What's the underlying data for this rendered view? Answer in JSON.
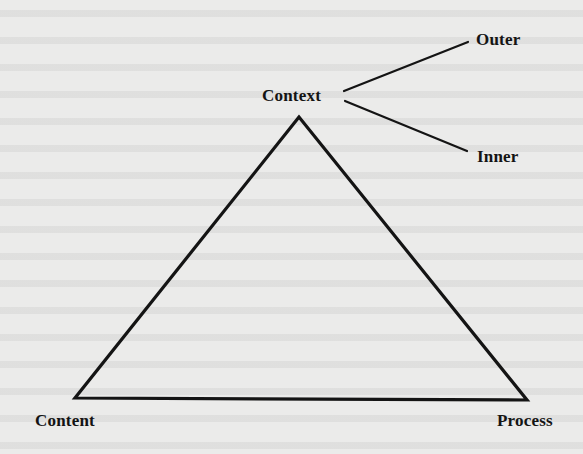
{
  "diagram": {
    "type": "triangle-with-branches",
    "nodes": {
      "context": {
        "label": "Context",
        "position": "apex"
      },
      "content": {
        "label": "Content",
        "position": "bottom-left"
      },
      "process": {
        "label": "Process",
        "position": "bottom-right"
      },
      "outer": {
        "label": "Outer",
        "position": "branch-upper-right"
      },
      "inner": {
        "label": "Inner",
        "position": "branch-lower-right"
      }
    },
    "edges": [
      {
        "from": "context",
        "to": "content"
      },
      {
        "from": "context",
        "to": "process"
      },
      {
        "from": "content",
        "to": "process"
      },
      {
        "from": "context",
        "to": "outer"
      },
      {
        "from": "context",
        "to": "inner"
      }
    ],
    "colors": {
      "line": "#141414",
      "text": "#141414",
      "background": "#ebebea"
    }
  }
}
